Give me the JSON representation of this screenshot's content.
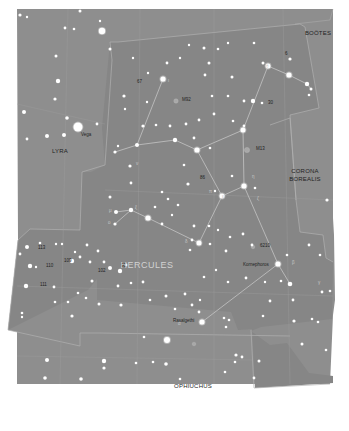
{
  "map": {
    "title": "Hercules star chart",
    "colors": {
      "page_bg": "#ffffff",
      "sky_bg": "#8e8e8e",
      "hercules_region": "#868686",
      "boundary": "#b4b4b4",
      "stick_figure": "#c4c4c4",
      "star": "#ffffff",
      "label": "#1e1e1e",
      "hercules_label": "#d2d2d2",
      "deep_sky": "#a8a8a8"
    },
    "constellations": [
      {
        "name": "HERCULES",
        "x": 147,
        "y": 268,
        "style": "main"
      },
      {
        "name": "LYRA",
        "x": 60,
        "y": 153,
        "style": "neighbor"
      },
      {
        "name": "BOÖTES",
        "x": 318,
        "y": 35,
        "style": "neighbor"
      },
      {
        "name": "CORONA",
        "x": 305,
        "y": 173,
        "style": "neighbor"
      },
      {
        "name": "BOREALIS",
        "x": 305,
        "y": 181,
        "style": "neighbor"
      },
      {
        "name": "OPHIUCHUS",
        "x": 193,
        "y": 388,
        "style": "neighbor"
      }
    ],
    "star_names": [
      {
        "name": "Vega",
        "x": 81,
        "y": 136
      },
      {
        "name": "Kornephoros",
        "x": 243,
        "y": 266
      },
      {
        "name": "Rasalgethi",
        "x": 173,
        "y": 322
      }
    ],
    "numbered_labels": [
      {
        "text": "M92",
        "x": 182,
        "y": 101
      },
      {
        "text": "M13",
        "x": 256,
        "y": 150
      },
      {
        "text": "6210",
        "x": 260,
        "y": 247
      },
      {
        "text": "67",
        "x": 137,
        "y": 83
      },
      {
        "text": "30",
        "x": 268,
        "y": 104
      },
      {
        "text": "86",
        "x": 200,
        "y": 179
      },
      {
        "text": "96",
        "x": 121,
        "y": 267
      },
      {
        "text": "102",
        "x": 98,
        "y": 272
      },
      {
        "text": "109",
        "x": 64,
        "y": 262
      },
      {
        "text": "110",
        "x": 46,
        "y": 267
      },
      {
        "text": "113",
        "x": 38,
        "y": 249
      },
      {
        "text": "111",
        "x": 40,
        "y": 286
      },
      {
        "text": "6",
        "x": 285,
        "y": 55
      }
    ],
    "greek_labels": [
      {
        "text": "ι",
        "x": 168,
        "y": 82
      },
      {
        "text": "θ",
        "x": 266,
        "y": 68
      },
      {
        "text": "η",
        "x": 252,
        "y": 178
      },
      {
        "text": "ζ",
        "x": 257,
        "y": 200
      },
      {
        "text": "π",
        "x": 209,
        "y": 193
      },
      {
        "text": "ε",
        "x": 222,
        "y": 198
      },
      {
        "text": "β",
        "x": 292,
        "y": 264
      },
      {
        "text": "γ",
        "x": 318,
        "y": 284
      },
      {
        "text": "α",
        "x": 178,
        "y": 325
      },
      {
        "text": "δ",
        "x": 185,
        "y": 243
      },
      {
        "text": "μ",
        "x": 109,
        "y": 212
      },
      {
        "text": "ν",
        "x": 136,
        "y": 165
      },
      {
        "text": "ξ",
        "x": 135,
        "y": 209
      },
      {
        "text": "ο",
        "x": 108,
        "y": 224
      }
    ],
    "stars": [
      {
        "x": 78,
        "y": 127,
        "r": 4.5
      },
      {
        "x": 102,
        "y": 31,
        "r": 3.2
      },
      {
        "x": 20,
        "y": 15,
        "r": 1.6
      },
      {
        "x": 27,
        "y": 17,
        "r": 1.2
      },
      {
        "x": 80,
        "y": 11,
        "r": 1.5
      },
      {
        "x": 100,
        "y": 21,
        "r": 1.2
      },
      {
        "x": 65,
        "y": 28,
        "r": 1.4
      },
      {
        "x": 74,
        "y": 29,
        "r": 1.3
      },
      {
        "x": 56,
        "y": 56,
        "r": 1.5
      },
      {
        "x": 58,
        "y": 81,
        "r": 2.2
      },
      {
        "x": 55,
        "y": 99,
        "r": 1.6
      },
      {
        "x": 24,
        "y": 112,
        "r": 2.0
      },
      {
        "x": 67,
        "y": 118,
        "r": 1.8
      },
      {
        "x": 97,
        "y": 124,
        "r": 1.4
      },
      {
        "x": 47,
        "y": 136,
        "r": 2.0
      },
      {
        "x": 64,
        "y": 135,
        "r": 2.0
      },
      {
        "x": 27,
        "y": 139,
        "r": 1.4
      },
      {
        "x": 110,
        "y": 49,
        "r": 1.5
      },
      {
        "x": 133,
        "y": 58,
        "r": 1.2
      },
      {
        "x": 163,
        "y": 79,
        "r": 2.6
      },
      {
        "x": 148,
        "y": 73,
        "r": 1.2
      },
      {
        "x": 124,
        "y": 96,
        "r": 1.6
      },
      {
        "x": 125,
        "y": 109,
        "r": 1.2
      },
      {
        "x": 143,
        "y": 126,
        "r": 1.6
      },
      {
        "x": 147,
        "y": 102,
        "r": 1.2
      },
      {
        "x": 156,
        "y": 125,
        "r": 1.3
      },
      {
        "x": 167,
        "y": 63,
        "r": 1.4
      },
      {
        "x": 180,
        "y": 58,
        "r": 1.2
      },
      {
        "x": 204,
        "y": 48,
        "r": 1.5
      },
      {
        "x": 209,
        "y": 63,
        "r": 1.5
      },
      {
        "x": 218,
        "y": 49,
        "r": 1.3
      },
      {
        "x": 189,
        "y": 45,
        "r": 1.2
      },
      {
        "x": 228,
        "y": 43,
        "r": 1.2
      },
      {
        "x": 254,
        "y": 43,
        "r": 1.3
      },
      {
        "x": 263,
        "y": 63,
        "r": 1.5
      },
      {
        "x": 268,
        "y": 66,
        "r": 2.5
      },
      {
        "x": 289,
        "y": 75,
        "r": 2.6
      },
      {
        "x": 290,
        "y": 59,
        "r": 1.6
      },
      {
        "x": 307,
        "y": 84,
        "r": 2.2
      },
      {
        "x": 311,
        "y": 89,
        "r": 1.5
      },
      {
        "x": 309,
        "y": 95,
        "r": 1.3
      },
      {
        "x": 253,
        "y": 101,
        "r": 2.2
      },
      {
        "x": 262,
        "y": 103,
        "r": 1.3
      },
      {
        "x": 244,
        "y": 101,
        "r": 1.4
      },
      {
        "x": 228,
        "y": 96,
        "r": 1.3
      },
      {
        "x": 233,
        "y": 121,
        "r": 1.3
      },
      {
        "x": 244,
        "y": 126,
        "r": 1.4
      },
      {
        "x": 243,
        "y": 130,
        "r": 2.5
      },
      {
        "x": 205,
        "y": 75,
        "r": 1.4
      },
      {
        "x": 212,
        "y": 96,
        "r": 1.3
      },
      {
        "x": 232,
        "y": 77,
        "r": 1.5
      },
      {
        "x": 214,
        "y": 114,
        "r": 1.4
      },
      {
        "x": 199,
        "y": 120,
        "r": 1.4
      },
      {
        "x": 186,
        "y": 124,
        "r": 1.4
      },
      {
        "x": 194,
        "y": 138,
        "r": 1.4
      },
      {
        "x": 170,
        "y": 126,
        "r": 1.4
      },
      {
        "x": 175,
        "y": 140,
        "r": 2.2
      },
      {
        "x": 197,
        "y": 150,
        "r": 2.6
      },
      {
        "x": 210,
        "y": 148,
        "r": 1.3
      },
      {
        "x": 184,
        "y": 165,
        "r": 1.3
      },
      {
        "x": 188,
        "y": 184,
        "r": 1.6
      },
      {
        "x": 215,
        "y": 191,
        "r": 1.2
      },
      {
        "x": 222,
        "y": 196,
        "r": 2.5
      },
      {
        "x": 244,
        "y": 186,
        "r": 2.6
      },
      {
        "x": 232,
        "y": 176,
        "r": 1.3
      },
      {
        "x": 255,
        "y": 188,
        "r": 1.3
      },
      {
        "x": 137,
        "y": 145,
        "r": 2.0
      },
      {
        "x": 115,
        "y": 152,
        "r": 1.6
      },
      {
        "x": 118,
        "y": 146,
        "r": 1.2
      },
      {
        "x": 130,
        "y": 166,
        "r": 1.6
      },
      {
        "x": 131,
        "y": 183,
        "r": 1.4
      },
      {
        "x": 110,
        "y": 197,
        "r": 1.5
      },
      {
        "x": 116,
        "y": 212,
        "r": 2.0
      },
      {
        "x": 131,
        "y": 210,
        "r": 2.2
      },
      {
        "x": 115,
        "y": 224,
        "r": 1.6
      },
      {
        "x": 148,
        "y": 218,
        "r": 2.6
      },
      {
        "x": 162,
        "y": 224,
        "r": 1.4
      },
      {
        "x": 155,
        "y": 207,
        "r": 1.3
      },
      {
        "x": 162,
        "y": 192,
        "r": 1.3
      },
      {
        "x": 168,
        "y": 199,
        "r": 1.3
      },
      {
        "x": 178,
        "y": 205,
        "r": 1.3
      },
      {
        "x": 172,
        "y": 215,
        "r": 1.2
      },
      {
        "x": 194,
        "y": 226,
        "r": 1.4
      },
      {
        "x": 199,
        "y": 243,
        "r": 2.5
      },
      {
        "x": 192,
        "y": 240,
        "r": 1.4
      },
      {
        "x": 190,
        "y": 250,
        "r": 1.3
      },
      {
        "x": 210,
        "y": 244,
        "r": 1.3
      },
      {
        "x": 209,
        "y": 226,
        "r": 1.3
      },
      {
        "x": 218,
        "y": 230,
        "r": 1.2
      },
      {
        "x": 230,
        "y": 237,
        "r": 1.3
      },
      {
        "x": 243,
        "y": 234,
        "r": 1.4
      },
      {
        "x": 226,
        "y": 251,
        "r": 1.4
      },
      {
        "x": 252,
        "y": 245,
        "r": 1.4
      },
      {
        "x": 278,
        "y": 264,
        "r": 2.6
      },
      {
        "x": 290,
        "y": 284,
        "r": 2.3
      },
      {
        "x": 281,
        "y": 281,
        "r": 1.3
      },
      {
        "x": 309,
        "y": 245,
        "r": 1.4
      },
      {
        "x": 327,
        "y": 200,
        "r": 1.6
      },
      {
        "x": 320,
        "y": 255,
        "r": 1.3
      },
      {
        "x": 287,
        "y": 255,
        "r": 1.3
      },
      {
        "x": 246,
        "y": 278,
        "r": 1.4
      },
      {
        "x": 228,
        "y": 282,
        "r": 1.3
      },
      {
        "x": 204,
        "y": 277,
        "r": 1.3
      },
      {
        "x": 216,
        "y": 270,
        "r": 1.2
      },
      {
        "x": 185,
        "y": 294,
        "r": 1.4
      },
      {
        "x": 192,
        "y": 305,
        "r": 1.4
      },
      {
        "x": 200,
        "y": 300,
        "r": 1.2
      },
      {
        "x": 175,
        "y": 309,
        "r": 1.3
      },
      {
        "x": 199,
        "y": 312,
        "r": 1.4
      },
      {
        "x": 229,
        "y": 320,
        "r": 1.3
      },
      {
        "x": 202,
        "y": 322,
        "r": 2.6
      },
      {
        "x": 224,
        "y": 318,
        "r": 1.3
      },
      {
        "x": 226,
        "y": 327,
        "r": 1.3
      },
      {
        "x": 263,
        "y": 316,
        "r": 1.3
      },
      {
        "x": 270,
        "y": 301,
        "r": 1.4
      },
      {
        "x": 293,
        "y": 300,
        "r": 1.4
      },
      {
        "x": 294,
        "y": 321,
        "r": 1.6
      },
      {
        "x": 312,
        "y": 319,
        "r": 1.3
      },
      {
        "x": 318,
        "y": 322,
        "r": 1.3
      },
      {
        "x": 322,
        "y": 292,
        "r": 1.4
      },
      {
        "x": 330,
        "y": 291,
        "r": 1.3
      },
      {
        "x": 265,
        "y": 282,
        "r": 1.2
      },
      {
        "x": 143,
        "y": 282,
        "r": 1.4
      },
      {
        "x": 120,
        "y": 271,
        "r": 2.2
      },
      {
        "x": 126,
        "y": 265,
        "r": 1.4
      },
      {
        "x": 110,
        "y": 268,
        "r": 2.0
      },
      {
        "x": 104,
        "y": 262,
        "r": 1.4
      },
      {
        "x": 90,
        "y": 262,
        "r": 1.4
      },
      {
        "x": 80,
        "y": 257,
        "r": 1.4
      },
      {
        "x": 72,
        "y": 261,
        "r": 2.2
      },
      {
        "x": 87,
        "y": 245,
        "r": 1.4
      },
      {
        "x": 98,
        "y": 251,
        "r": 1.4
      },
      {
        "x": 75,
        "y": 252,
        "r": 1.2
      },
      {
        "x": 62,
        "y": 244,
        "r": 1.2
      },
      {
        "x": 56,
        "y": 244,
        "r": 1.2
      },
      {
        "x": 27,
        "y": 247,
        "r": 2.0
      },
      {
        "x": 40,
        "y": 243,
        "r": 1.3
      },
      {
        "x": 20,
        "y": 254,
        "r": 1.4
      },
      {
        "x": 30,
        "y": 266,
        "r": 2.2
      },
      {
        "x": 36,
        "y": 267,
        "r": 1.2
      },
      {
        "x": 26,
        "y": 286,
        "r": 2.2
      },
      {
        "x": 54,
        "y": 287,
        "r": 1.4
      },
      {
        "x": 78,
        "y": 293,
        "r": 1.3
      },
      {
        "x": 92,
        "y": 281,
        "r": 1.5
      },
      {
        "x": 118,
        "y": 286,
        "r": 1.4
      },
      {
        "x": 131,
        "y": 283,
        "r": 1.3
      },
      {
        "x": 86,
        "y": 298,
        "r": 1.3
      },
      {
        "x": 99,
        "y": 304,
        "r": 1.5
      },
      {
        "x": 68,
        "y": 302,
        "r": 1.3
      },
      {
        "x": 55,
        "y": 302,
        "r": 1.3
      },
      {
        "x": 22,
        "y": 313,
        "r": 1.3
      },
      {
        "x": 22,
        "y": 317,
        "r": 1.2
      },
      {
        "x": 72,
        "y": 316,
        "r": 1.6
      },
      {
        "x": 121,
        "y": 305,
        "r": 1.6
      },
      {
        "x": 166,
        "y": 296,
        "r": 1.5
      },
      {
        "x": 150,
        "y": 300,
        "r": 1.3
      },
      {
        "x": 167,
        "y": 340,
        "r": 3.0
      },
      {
        "x": 166,
        "y": 364,
        "r": 1.8
      },
      {
        "x": 144,
        "y": 337,
        "r": 1.3
      },
      {
        "x": 153,
        "y": 362,
        "r": 1.3
      },
      {
        "x": 136,
        "y": 363,
        "r": 1.3
      },
      {
        "x": 47,
        "y": 360,
        "r": 2.0
      },
      {
        "x": 104,
        "y": 361,
        "r": 2.2
      },
      {
        "x": 104,
        "y": 368,
        "r": 1.6
      },
      {
        "x": 81,
        "y": 379,
        "r": 1.8
      },
      {
        "x": 45,
        "y": 378,
        "r": 1.8
      },
      {
        "x": 74,
        "y": 410,
        "r": 1.5
      },
      {
        "x": 95,
        "y": 412,
        "r": 1.4
      },
      {
        "x": 115,
        "y": 417,
        "r": 1.5
      },
      {
        "x": 148,
        "y": 404,
        "r": 2.2
      },
      {
        "x": 182,
        "y": 406,
        "r": 1.8
      },
      {
        "x": 236,
        "y": 355,
        "r": 1.6
      },
      {
        "x": 242,
        "y": 357,
        "r": 1.4
      },
      {
        "x": 235,
        "y": 362,
        "r": 1.3
      },
      {
        "x": 225,
        "y": 372,
        "r": 1.3
      },
      {
        "x": 259,
        "y": 361,
        "r": 1.5
      },
      {
        "x": 254,
        "y": 378,
        "r": 1.4
      },
      {
        "x": 302,
        "y": 344,
        "r": 1.5
      },
      {
        "x": 326,
        "y": 350,
        "r": 1.3
      },
      {
        "x": 261,
        "y": 396,
        "r": 1.4
      },
      {
        "x": 276,
        "y": 402,
        "r": 1.4
      },
      {
        "x": 326,
        "y": 397,
        "r": 1.5
      },
      {
        "x": 331,
        "y": 387,
        "r": 1.3
      },
      {
        "x": 180,
        "y": 379,
        "r": 1.3
      }
    ],
    "stick_figure": [
      [
        [
          163,
          79
        ],
        [
          137,
          145
        ]
      ],
      [
        [
          137,
          145
        ],
        [
          115,
          152
        ]
      ],
      [
        [
          137,
          145
        ],
        [
          175,
          140
        ]
      ],
      [
        [
          175,
          140
        ],
        [
          197,
          150
        ]
      ],
      [
        [
          197,
          150
        ],
        [
          243,
          130
        ]
      ],
      [
        [
          243,
          130
        ],
        [
          268,
          66
        ]
      ],
      [
        [
          268,
          66
        ],
        [
          289,
          75
        ]
      ],
      [
        [
          289,
          75
        ],
        [
          307,
          84
        ]
      ],
      [
        [
          307,
          84
        ],
        [
          311,
          89
        ]
      ],
      [
        [
          197,
          150
        ],
        [
          222,
          196
        ]
      ],
      [
        [
          243,
          130
        ],
        [
          244,
          186
        ]
      ],
      [
        [
          244,
          186
        ],
        [
          222,
          196
        ]
      ],
      [
        [
          222,
          196
        ],
        [
          199,
          243
        ]
      ],
      [
        [
          244,
          186
        ],
        [
          278,
          264
        ]
      ],
      [
        [
          278,
          264
        ],
        [
          290,
          284
        ]
      ],
      [
        [
          278,
          264
        ],
        [
          202,
          322
        ]
      ],
      [
        [
          199,
          243
        ],
        [
          148,
          218
        ]
      ],
      [
        [
          148,
          218
        ],
        [
          131,
          210
        ]
      ],
      [
        [
          131,
          210
        ],
        [
          116,
          212
        ]
      ],
      [
        [
          131,
          210
        ],
        [
          115,
          224
        ]
      ]
    ],
    "deep_sky": [
      {
        "x": 176,
        "y": 101,
        "r": 2.2
      },
      {
        "x": 247,
        "y": 150,
        "r": 2.6
      },
      {
        "x": 253,
        "y": 247,
        "r": 1.8
      },
      {
        "x": 194,
        "y": 344,
        "r": 1.8
      }
    ]
  }
}
